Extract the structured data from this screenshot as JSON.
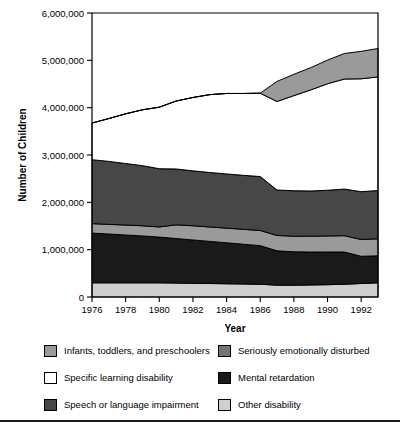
{
  "chart_data": {
    "type": "area",
    "title": "",
    "subtitle": "",
    "xlabel": "Year",
    "ylabel": "Number of Children",
    "xlim": [
      1976,
      1993
    ],
    "ylim": [
      0,
      6000000
    ],
    "grid": false,
    "legend_position": "bottom",
    "stacked": true,
    "x": [
      1976,
      1977,
      1978,
      1979,
      1980,
      1981,
      1982,
      1983,
      1984,
      1985,
      1986,
      1987,
      1988,
      1989,
      1990,
      1991,
      1992,
      1993
    ],
    "xticks": [
      1976,
      1978,
      1980,
      1982,
      1984,
      1986,
      1988,
      1990,
      1992
    ],
    "xtick_labels": [
      "1976",
      "1978",
      "1980",
      "1982",
      "1984",
      "1986",
      "1988",
      "1990",
      "1992"
    ],
    "yticks": [
      0,
      1000000,
      2000000,
      3000000,
      4000000,
      5000000,
      6000000
    ],
    "ytick_labels": [
      "0",
      "1,000,000",
      "2,000,000",
      "3,000,000",
      "4,000,000",
      "5,000,000",
      "6,000,000"
    ],
    "series": [
      {
        "name": "Other disability",
        "color": "#cfcfcf",
        "values": [
          300000,
          300000,
          300000,
          300000,
          300000,
          295000,
          290000,
          285000,
          280000,
          275000,
          270000,
          250000,
          250000,
          255000,
          260000,
          270000,
          285000,
          300000
        ]
      },
      {
        "name": "Mental retardation",
        "color": "#1a1a1a",
        "values": [
          1050000,
          1030000,
          1010000,
          990000,
          965000,
          940000,
          915000,
          890000,
          865000,
          840000,
          815000,
          725000,
          705000,
          695000,
          690000,
          680000,
          575000,
          570000
        ]
      },
      {
        "name": "Seriously emotionally disturbed",
        "color": "#9a9a9a",
        "values": [
          200000,
          205000,
          210000,
          215000,
          215000,
          290000,
          300000,
          305000,
          310000,
          315000,
          320000,
          325000,
          330000,
          335000,
          340000,
          345000,
          355000,
          360000
        ]
      },
      {
        "name": "Speech or language impairment",
        "color": "#474747",
        "values": [
          1350000,
          1330000,
          1300000,
          1270000,
          1230000,
          1180000,
          1160000,
          1150000,
          1145000,
          1140000,
          1140000,
          960000,
          960000,
          955000,
          965000,
          985000,
          1010000,
          1020000
        ]
      },
      {
        "name": "Specific learning disability",
        "color": "#ffffff",
        "values": [
          775000,
          905000,
          1050000,
          1180000,
          1300000,
          1435000,
          1550000,
          1645000,
          1700000,
          1730000,
          1760000,
          1870000,
          2010000,
          2135000,
          2250000,
          2325000,
          2385000,
          2400000
        ]
      },
      {
        "name": "Infants, toddlers, and preschoolers",
        "color": "#9a9a9a",
        "values": [
          0,
          0,
          0,
          0,
          0,
          0,
          0,
          0,
          0,
          0,
          0,
          425000,
          450000,
          470000,
          500000,
          540000,
          580000,
          600000
        ]
      }
    ]
  },
  "legend": {
    "items": [
      {
        "label": "Infants, toddlers, and preschoolers",
        "color": "#9a9a9a",
        "column": "left"
      },
      {
        "label": "Specific learning disability",
        "color": "#ffffff",
        "column": "left"
      },
      {
        "label": "Speech or language impairment",
        "color": "#474747",
        "column": "left"
      },
      {
        "label": "Seriously emotionally disturbed",
        "color": "#757575",
        "column": "right"
      },
      {
        "label": "Mental retardation",
        "color": "#1a1a1a",
        "column": "right"
      },
      {
        "label": "Other disability",
        "color": "#cfcfcf",
        "column": "right"
      }
    ]
  }
}
